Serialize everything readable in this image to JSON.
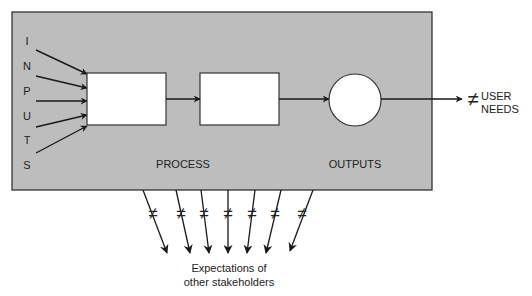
{
  "diagram": {
    "inputs_letters": [
      "I",
      "N",
      "P",
      "U",
      "T",
      "S"
    ],
    "process_label": "PROCESS",
    "outputs_label": "OUTPUTS",
    "not_equal_symbol": "≠",
    "user_needs": {
      "line1": "USER",
      "line2": "NEEDS"
    },
    "stakeholders": {
      "line1": "Expectations of",
      "line2": "other stakeholders"
    },
    "stakeholder_arrow_count": 7,
    "colors": {
      "system_box": "#bdbdbd",
      "stroke": "#1a1a1a",
      "node_fill": "#ffffff"
    }
  }
}
